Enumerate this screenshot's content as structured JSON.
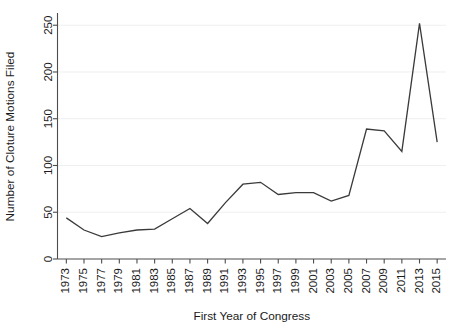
{
  "chart_data": {
    "type": "line",
    "title": "",
    "xlabel": "First Year of Congress",
    "ylabel": "Number of Cloture Motions Filed",
    "x": [
      1973,
      1975,
      1977,
      1979,
      1981,
      1983,
      1985,
      1987,
      1989,
      1991,
      1993,
      1995,
      1997,
      1999,
      2001,
      2003,
      2005,
      2007,
      2009,
      2011,
      2013,
      2015
    ],
    "xtick_labels": [
      "1973",
      "1975",
      "1977",
      "1979",
      "1981",
      "1983",
      "1985",
      "1987",
      "1989",
      "1991",
      "1993",
      "1995",
      "1997",
      "1999",
      "2001",
      "2003",
      "2005",
      "2007",
      "2009",
      "2011",
      "2013",
      "2015"
    ],
    "values": [
      44,
      31,
      24,
      28,
      31,
      32,
      43,
      54,
      38,
      60,
      80,
      82,
      69,
      71,
      71,
      62,
      68,
      139,
      137,
      115,
      252,
      125
    ],
    "yticks": [
      0,
      50,
      100,
      150,
      200,
      250
    ],
    "ytick_labels": [
      "0",
      "50",
      "100",
      "150",
      "200",
      "250"
    ],
    "ylim": [
      0,
      262
    ],
    "xlim": [
      1972,
      2016
    ],
    "grid": "horizontal",
    "legend": "none",
    "series_color": "#3a3a3a",
    "grid_color": "#efeff1",
    "axis_color": "#4d4d4d",
    "background": "#ffffff"
  }
}
